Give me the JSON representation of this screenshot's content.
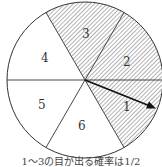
{
  "diagram": {
    "type": "spinner",
    "sectors": [
      {
        "label": "1",
        "shaded": true
      },
      {
        "label": "2",
        "shaded": true
      },
      {
        "label": "3",
        "shaded": true
      },
      {
        "label": "4",
        "shaded": false
      },
      {
        "label": "5",
        "shaded": false
      },
      {
        "label": "6",
        "shaded": false
      }
    ],
    "caption": "1～3の目が出る確率は1/2",
    "colors": {
      "stroke": "#333333",
      "hatch": "#555555",
      "background": "#ffffff"
    }
  }
}
